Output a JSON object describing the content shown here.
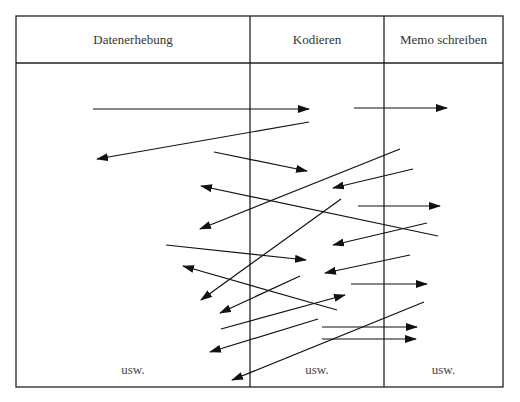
{
  "table": {
    "columns": [
      {
        "label": "Datenerhebung",
        "footer": "usw."
      },
      {
        "label": "Kodieren",
        "footer": "usw."
      },
      {
        "label": "Memo schreiben",
        "footer": "usw."
      }
    ],
    "border_color": "#222222"
  },
  "arrows": [
    {
      "from": [
        93,
        109
      ],
      "to": [
        309,
        109
      ]
    },
    {
      "from": [
        354,
        108
      ],
      "to": [
        447,
        108
      ]
    },
    {
      "from": [
        309,
        122
      ],
      "to": [
        97,
        159
      ]
    },
    {
      "from": [
        214,
        152
      ],
      "to": [
        307,
        171
      ]
    },
    {
      "from": [
        400,
        149
      ],
      "to": [
        200,
        229
      ]
    },
    {
      "from": [
        413,
        169
      ],
      "to": [
        333,
        188
      ]
    },
    {
      "from": [
        438,
        236
      ],
      "to": [
        201,
        186
      ]
    },
    {
      "from": [
        358,
        206
      ],
      "to": [
        440,
        206
      ]
    },
    {
      "from": [
        341,
        199
      ],
      "to": [
        201,
        300
      ]
    },
    {
      "from": [
        427,
        223
      ],
      "to": [
        333,
        245
      ]
    },
    {
      "from": [
        166,
        245
      ],
      "to": [
        306,
        260
      ]
    },
    {
      "from": [
        410,
        255
      ],
      "to": [
        325,
        273
      ]
    },
    {
      "from": [
        337,
        310
      ],
      "to": [
        183,
        266
      ]
    },
    {
      "from": [
        351,
        284
      ],
      "to": [
        427,
        284
      ]
    },
    {
      "from": [
        300,
        276
      ],
      "to": [
        220,
        313
      ]
    },
    {
      "from": [
        221,
        329
      ],
      "to": [
        345,
        295
      ]
    },
    {
      "from": [
        318,
        319
      ],
      "to": [
        210,
        352
      ]
    },
    {
      "from": [
        322,
        327
      ],
      "to": [
        417,
        327
      ]
    },
    {
      "from": [
        322,
        339
      ],
      "to": [
        416,
        339
      ]
    },
    {
      "from": [
        424,
        302
      ],
      "to": [
        232,
        380
      ]
    }
  ]
}
